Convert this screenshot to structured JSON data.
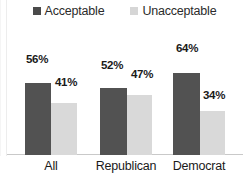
{
  "chart_data": {
    "type": "bar",
    "title": "",
    "xlabel": "",
    "ylabel": "",
    "ylim": [
      0,
      100
    ],
    "grid": false,
    "legend_position": "top-center",
    "categories": [
      "All",
      "Republican",
      "Democrat"
    ],
    "series": [
      {
        "name": "Acceptable",
        "color": "#525252",
        "values": [
          56,
          52,
          64
        ],
        "labels": [
          "56%",
          "52%",
          "64%"
        ]
      },
      {
        "name": "Unacceptable",
        "color": "#d9d9d9",
        "values": [
          41,
          47,
          34
        ],
        "labels": [
          "41%",
          "47%",
          "34%"
        ]
      }
    ]
  },
  "legend": {
    "items": [
      {
        "label": "Acceptable",
        "swatch_color": "#4a4a4a"
      },
      {
        "label": "Unacceptable",
        "swatch_color": "#d6d6d6"
      }
    ]
  },
  "axis": {
    "categories": [
      "All",
      "Republican",
      "Democrat"
    ]
  }
}
